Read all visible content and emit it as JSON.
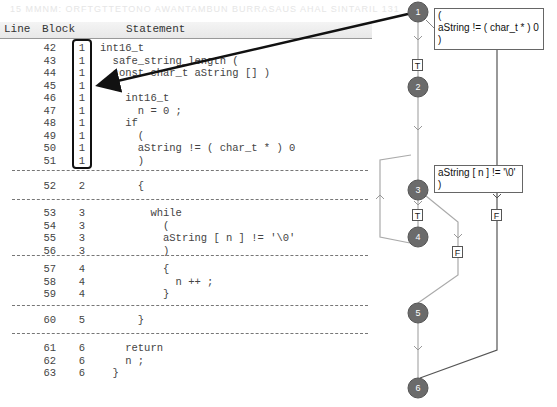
{
  "background_text": "15 MMNM: ORFTGTTETONO AWANTAMBUN BURRASAUS AHAL SINTARIL 131",
  "table": {
    "headers": {
      "line": "Line",
      "block": "Block",
      "statement": "Statement"
    },
    "rows": [
      {
        "line": "42",
        "block": "1",
        "statement": "int16_t"
      },
      {
        "line": "43",
        "block": "1",
        "statement": "  safe_string_length ("
      },
      {
        "line": "44",
        "block": "1",
        "statement": "  const char_t aString [] )"
      },
      {
        "line": "45",
        "block": "1",
        "statement": "  {"
      },
      {
        "line": "46",
        "block": "1",
        "statement": "    int16_t"
      },
      {
        "line": "47",
        "block": "1",
        "statement": "      n = 0 ;"
      },
      {
        "line": "48",
        "block": "1",
        "statement": "    if"
      },
      {
        "line": "49",
        "block": "1",
        "statement": "      ("
      },
      {
        "line": "50",
        "block": "1",
        "statement": "      aString != ( char_t * ) 0"
      },
      {
        "line": "51",
        "block": "1",
        "statement": "      )"
      },
      {
        "line": "52",
        "block": "2",
        "statement": "      {"
      },
      {
        "line": "53",
        "block": "3",
        "statement": "        while"
      },
      {
        "line": "54",
        "block": "3",
        "statement": "          ("
      },
      {
        "line": "55",
        "block": "3",
        "statement": "          aString [ n ] != '\\0'"
      },
      {
        "line": "56",
        "block": "3",
        "statement": "          )"
      },
      {
        "line": "57",
        "block": "4",
        "statement": "          {"
      },
      {
        "line": "58",
        "block": "4",
        "statement": "            n ++ ;"
      },
      {
        "line": "59",
        "block": "4",
        "statement": "          }"
      },
      {
        "line": "60",
        "block": "5",
        "statement": "      }"
      },
      {
        "line": "61",
        "block": "6",
        "statement": "    return"
      },
      {
        "line": "62",
        "block": "6",
        "statement": "    n ;"
      },
      {
        "line": "63",
        "block": "6",
        "statement": "  }"
      }
    ]
  },
  "flowgraph": {
    "nodes": [
      {
        "id": "1",
        "label": "1"
      },
      {
        "id": "2",
        "label": "2"
      },
      {
        "id": "3",
        "label": "3"
      },
      {
        "id": "4",
        "label": "4"
      },
      {
        "id": "5",
        "label": "5"
      },
      {
        "id": "6",
        "label": "6"
      }
    ],
    "conditions": {
      "node1": "(\naString != ( char_t * ) 0\n)",
      "node3": "aString [ n ] != '\\0'\n)"
    },
    "edge_labels": {
      "t1": "T",
      "t3": "T",
      "f1": "F",
      "f3": "F"
    },
    "colors": {
      "node_fill": "#6b6b6b",
      "edge": "#aaaaaa",
      "false_edge": "#555555",
      "annotation_arrow": "#111111"
    }
  }
}
